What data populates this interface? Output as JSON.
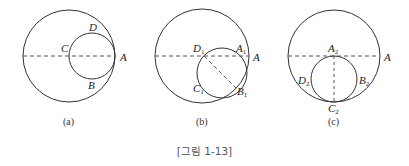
{
  "figure_caption": "[그림 1-13]",
  "colors": {
    "stroke": "#333333",
    "dash": "#555555",
    "text": "#222222",
    "caption": "#555555"
  },
  "panels": [
    {
      "id": "a",
      "caption": "(a)",
      "labels": {
        "A": "A",
        "B": "B",
        "C": "C",
        "D": "D"
      }
    },
    {
      "id": "b",
      "caption": "(b)",
      "labels": {
        "A": "A",
        "A1": "A",
        "B1": "B",
        "C1": "C",
        "D1": "D",
        "sub": "1"
      }
    },
    {
      "id": "c",
      "caption": "(c)",
      "labels": {
        "A": "A",
        "A2": "A",
        "B2": "B",
        "C2": "C",
        "D2": "D",
        "sub": "2"
      }
    }
  ]
}
